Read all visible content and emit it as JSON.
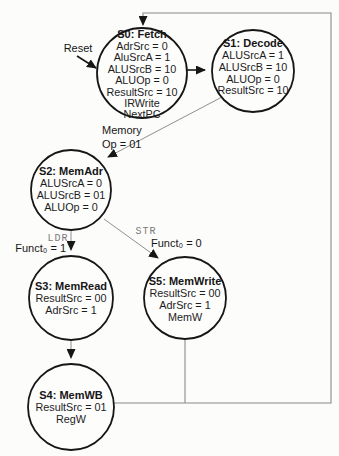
{
  "colors": {
    "ink": "#161616",
    "thin_line_gray": "#8f8f8f",
    "mono_label_gray": "#7a7a7a",
    "background": "#fcfcfb"
  },
  "states": {
    "s0": {
      "title": "S0: Fetch",
      "lines": [
        "AdrSrc = 0",
        "AluSrcA = 1",
        "ALUSrcB = 10",
        "ALUOp = 0",
        "ResultSrc = 10",
        "IRWrite",
        "NextPC"
      ]
    },
    "s1": {
      "title": "S1: Decode",
      "lines": [
        "ALUSrcA = 1",
        "ALUSrcB = 10",
        "ALUOp = 0",
        "ResultSrc = 10"
      ]
    },
    "s2": {
      "title": "S2: MemAdr",
      "lines": [
        "ALUSrcA = 0",
        "ALUSrcB = 01",
        "ALUOp = 0"
      ]
    },
    "s3": {
      "title": "S3: MemRead",
      "lines": [
        "ResultSrc = 00",
        "AdrSrc = 1"
      ]
    },
    "s5": {
      "title": "S5: MemWrite",
      "lines": [
        "ResultSrc = 00",
        "AdrSrc = 1",
        "MemW"
      ]
    },
    "s4": {
      "title": "S4: MemWB",
      "lines": [
        "ResultSrc = 01",
        "RegW"
      ]
    }
  },
  "transitions": {
    "reset": {
      "label": "Reset"
    },
    "decode_to_memadr": {
      "label_line1": "Memory",
      "label_line2": "Op = 01"
    },
    "memadr_to_memread": {
      "mnemonic": "LDR",
      "condition": "Funct₀ = 1"
    },
    "memadr_to_memwrite": {
      "mnemonic": "STR",
      "condition": "Funct₀ = 0"
    }
  }
}
